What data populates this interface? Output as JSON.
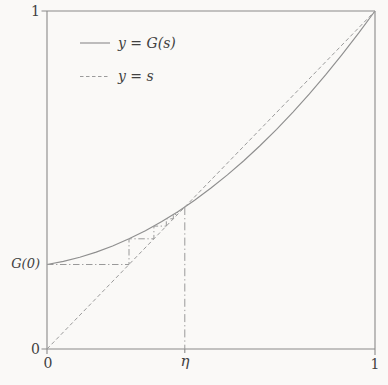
{
  "figure": {
    "background": "#faf9f7",
    "frame_color": "#8a8a8a",
    "curve_color": "#8f8f8f",
    "dash_color": "#9b9b9b",
    "cobweb_color": "#999999",
    "text_color": "#414141"
  },
  "legend": {
    "items": [
      {
        "label": "y = G(s)",
        "style": "solid"
      },
      {
        "label": "y = s",
        "style": "dashed"
      }
    ]
  },
  "axis": {
    "y_top_label": "1",
    "y_G0_label": "G(0)",
    "y_zero_label": "0",
    "x_zero_label": "0",
    "x_eta_label": "η",
    "x_one_label": "1"
  },
  "chart_data": {
    "type": "line",
    "title": "",
    "xlabel": "s",
    "ylabel": "y",
    "xlim": [
      0,
      1
    ],
    "ylim": [
      0,
      1
    ],
    "grid": false,
    "legend_position": "top-left",
    "x_ticks": [
      {
        "value": 0,
        "label": "0"
      },
      {
        "value": 0.42,
        "label": "η"
      },
      {
        "value": 1,
        "label": "1"
      }
    ],
    "y_ticks": [
      {
        "value": 0,
        "label": "0"
      },
      {
        "value": 0.25,
        "label": "G(0)"
      },
      {
        "value": 1,
        "label": "1"
      }
    ],
    "series": [
      {
        "name": "y = G(s)",
        "style": "solid",
        "x": [
          0,
          0.05,
          0.1,
          0.15,
          0.2,
          0.25,
          0.3,
          0.35,
          0.4,
          0.45,
          0.5,
          0.55,
          0.6,
          0.65,
          0.7,
          0.75,
          0.8,
          0.85,
          0.9,
          0.95,
          1
        ],
        "y": [
          0.25,
          0.2592,
          0.2715,
          0.2866,
          0.3048,
          0.3259,
          0.3501,
          0.3771,
          0.4072,
          0.4402,
          0.4763,
          0.5152,
          0.5572,
          0.6021,
          0.6501,
          0.7009,
          0.7548,
          0.8116,
          0.8715,
          0.9342,
          1.0
        ]
      },
      {
        "name": "y = s",
        "style": "dashed",
        "x": [
          0,
          1
        ],
        "y": [
          0,
          1
        ]
      }
    ],
    "annotations": {
      "G0": 0.25,
      "eta": 0.42,
      "cobweb_points": [
        [
          0,
          0.25
        ],
        [
          0.25,
          0.25
        ],
        [
          0.25,
          0.3259
        ],
        [
          0.3259,
          0.3259
        ],
        [
          0.3259,
          0.3637
        ],
        [
          0.3637,
          0.3637
        ],
        [
          0.3637,
          0.3851
        ],
        [
          0.3851,
          0.3851
        ],
        [
          0.3851,
          0.3979
        ],
        [
          0.3979,
          0.3979
        ],
        [
          0.3979,
          0.4059
        ]
      ],
      "eta_drop_line": [
        [
          0.42,
          0.42
        ],
        [
          0.42,
          0
        ]
      ]
    }
  }
}
